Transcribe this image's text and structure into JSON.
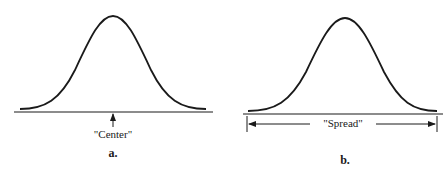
{
  "panels": [
    {
      "id": "a",
      "caption": "a.",
      "annotation": "\"Center\"",
      "concept": "center",
      "shape": "bell-curve"
    },
    {
      "id": "b",
      "caption": "b.",
      "annotation": "\"Spread\"",
      "concept": "spread",
      "shape": "bell-curve"
    }
  ],
  "colors": {
    "ink": "#1a1a1a",
    "background": "#ffffff"
  }
}
